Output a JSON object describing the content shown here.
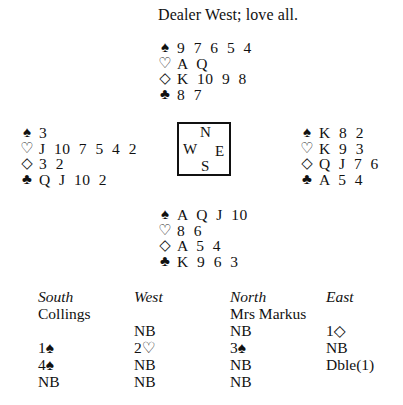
{
  "title": "Dealer West; love all.",
  "suits": {
    "spades": "♠",
    "hearts": "♡",
    "diamonds": "◇",
    "clubs": "♣"
  },
  "hands": {
    "north": {
      "spades": "9 7 6 5 4",
      "hearts": "A Q",
      "diamonds": "K 10 9 8",
      "clubs": "8 7"
    },
    "west": {
      "spades": "3",
      "hearts": "J 10 7 5 4 2",
      "diamonds": "3 2",
      "clubs": "Q J 10 2"
    },
    "east": {
      "spades": "K 8 2",
      "hearts": "K 9 3",
      "diamonds": "Q J 7 6",
      "clubs": "A 5 4"
    },
    "south": {
      "spades": "A Q J 10",
      "hearts": "8 6",
      "diamonds": "A 5 4",
      "clubs": "K 9 6 3"
    }
  },
  "compass": {
    "n": "N",
    "w": "W",
    "e": "E",
    "s": "S"
  },
  "auction": {
    "headers": [
      "South",
      "West",
      "North",
      "East"
    ],
    "players": [
      "Collings",
      "",
      "Mrs Markus",
      ""
    ],
    "rounds": [
      [
        "",
        "NB",
        "NB",
        "1◇"
      ],
      [
        "1♠",
        "2♡",
        "3♠",
        "NB"
      ],
      [
        "4♠",
        "NB",
        "NB",
        "Dble(1)"
      ],
      [
        "NB",
        "NB",
        "NB",
        ""
      ]
    ]
  }
}
